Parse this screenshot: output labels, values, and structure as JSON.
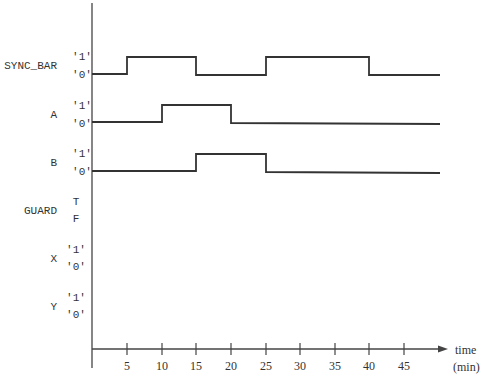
{
  "diagram": {
    "type": "timing-diagram",
    "x_axis": {
      "label_line1": "time",
      "label_line2": "(min)",
      "ticks": [
        "5",
        "10",
        "15",
        "20",
        "25",
        "30",
        "35",
        "40",
        "45"
      ]
    },
    "signals": [
      {
        "name": "SYNC_BAR",
        "high_label": "'1'",
        "low_label": "'0'",
        "transitions": [
          {
            "t": 0,
            "v": 0
          },
          {
            "t": 5,
            "v": 1
          },
          {
            "t": 15,
            "v": 0
          },
          {
            "t": 25,
            "v": 1
          },
          {
            "t": 40,
            "v": 0
          }
        ]
      },
      {
        "name": "A",
        "high_label": "'1'",
        "low_label": "'0'",
        "transitions": [
          {
            "t": 0,
            "v": 0
          },
          {
            "t": 10,
            "v": 1
          },
          {
            "t": 20,
            "v": 0
          }
        ]
      },
      {
        "name": "B",
        "high_label": "'1'",
        "low_label": "'0'",
        "transitions": [
          {
            "t": 0,
            "v": 0
          },
          {
            "t": 15,
            "v": 1
          },
          {
            "t": 25,
            "v": 0
          }
        ]
      },
      {
        "name": "GUARD",
        "high_label": "T",
        "low_label": "F",
        "transitions": []
      },
      {
        "name": "X",
        "high_label": "'1'",
        "low_label": "'0'",
        "transitions": []
      },
      {
        "name": "Y",
        "high_label": "'1'",
        "low_label": "'0'",
        "transitions": []
      }
    ]
  }
}
